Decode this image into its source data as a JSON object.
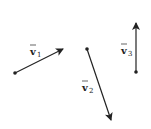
{
  "diagram": {
    "title": "",
    "vectors": [
      {
        "id": "v1",
        "label": "v",
        "subscript": "1",
        "tail": [
          15,
          73
        ],
        "head": [
          63,
          49
        ]
      },
      {
        "id": "v2",
        "label": "v",
        "subscript": "2",
        "tail": [
          87,
          49
        ],
        "head": [
          111,
          120
        ]
      },
      {
        "id": "v3",
        "label": "v",
        "subscript": "3",
        "tail": [
          136,
          72
        ],
        "head": [
          136,
          23
        ]
      }
    ],
    "colors": {
      "stroke": "#222222",
      "background": "#ffffff"
    }
  }
}
